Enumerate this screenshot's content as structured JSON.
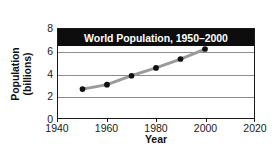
{
  "chart_data": {
    "type": "line",
    "title": "World Population, 1950–2000",
    "xlabel": "Year",
    "ylabel_line1": "Population",
    "ylabel_line2": "(billions)",
    "x": [
      1950,
      1960,
      1970,
      1980,
      1990,
      2000
    ],
    "values": [
      2.6,
      3.0,
      3.8,
      4.5,
      5.3,
      6.2
    ],
    "series": [
      {
        "name": "World population",
        "values": [
          2.6,
          3.0,
          3.8,
          4.5,
          5.3,
          6.2
        ]
      }
    ],
    "xlim": [
      1940,
      2020
    ],
    "ylim": [
      0,
      8
    ],
    "xticks": [
      1940,
      1960,
      1980,
      2000,
      2020
    ],
    "yticks": [
      8,
      6,
      4,
      2,
      0
    ],
    "xtick_labels": [
      "1940",
      "1960",
      "1980",
      "2000",
      "2020"
    ],
    "ytick_labels": [
      "8",
      "6",
      "4",
      "2",
      "0"
    ],
    "grid": "horizontal",
    "legend": "none",
    "line_color": "#9a9a9a",
    "marker_color": "#111111",
    "title_background": "#0d0d0d",
    "title_color": "#ffffff",
    "grid_color": "#8c8c8c",
    "axis_color": "#1a1a1a"
  }
}
